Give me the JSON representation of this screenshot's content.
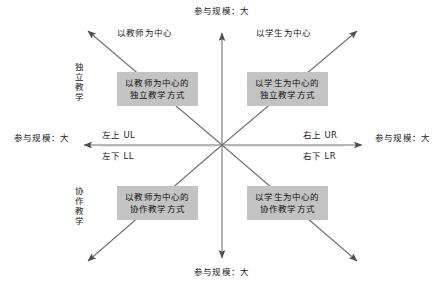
{
  "diagram": {
    "axes": {
      "top_label": "参与规模：大",
      "bottom_label": "参与规模：大",
      "left_label": "参与规模：大",
      "right_label": "参与规模：大"
    },
    "column_headers": {
      "left": "以教师为中心",
      "right": "以学生为中心"
    },
    "row_labels": {
      "top": "独立教学",
      "bottom": "协作教学"
    },
    "center_labels": {
      "upper_left": "左上 UL",
      "lower_left": "左下 LL",
      "upper_right": "右上 UR",
      "lower_right": "右下 LR"
    },
    "quadrants": [
      {
        "key": "upper-left",
        "line1": "以教师为中心的",
        "line2": "独立教学方式"
      },
      {
        "key": "upper-right",
        "line1": "以学生为中心的",
        "line2": "独立教学方式"
      },
      {
        "key": "lower-left",
        "line1": "以教师为中心的",
        "line2": "协作教学方式"
      },
      {
        "key": "lower-right",
        "line1": "以学生为中心的",
        "line2": "协作教学方式"
      }
    ],
    "colors": {
      "box_fill": "#c3c3c3",
      "line": "#555555",
      "text": "#1a1a1a",
      "background": "#ffffff"
    }
  }
}
